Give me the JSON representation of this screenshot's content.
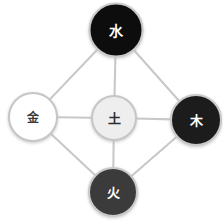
{
  "diagram": {
    "background_color": "#ffffff",
    "width": 223,
    "height": 224,
    "edge_color": "#c8c8c8",
    "edge_width": 2.1,
    "shadow_color": "#d9d9d9",
    "nodes": [
      {
        "id": "water",
        "label": "水",
        "position": "top",
        "cx": 116,
        "cy": 30,
        "r": 26.5,
        "fill": "#0a0a0a",
        "stroke": "#c9c9c9",
        "stroke_width": 2,
        "text_color": "#ffffff",
        "font_size": 14
      },
      {
        "id": "metal",
        "label": "金",
        "position": "left",
        "cx": 33,
        "cy": 117,
        "r": 24,
        "fill": "#ffffff",
        "stroke": "#c6c6c6",
        "stroke_width": 2,
        "text_color": "#3a3a3a",
        "font_size": 12
      },
      {
        "id": "earth",
        "label": "土",
        "position": "center",
        "cx": 114,
        "cy": 118,
        "r": 22,
        "fill": "#eeeeee",
        "stroke": "#c6c6c6",
        "stroke_width": 2,
        "text_color": "#2e2e2e",
        "font_size": 13
      },
      {
        "id": "wood",
        "label": "木",
        "position": "right",
        "cx": 196,
        "cy": 120,
        "r": 25,
        "fill": "#1c1c1c",
        "stroke": "#c9c9c9",
        "stroke_width": 2,
        "text_color": "#ffffff",
        "font_size": 13
      },
      {
        "id": "fire",
        "label": "火",
        "position": "bottom",
        "cx": 113,
        "cy": 192,
        "r": 24,
        "fill": "#3b3b3b",
        "stroke": "#c9c9c9",
        "stroke_width": 2,
        "text_color": "#ffffff",
        "font_size": 13
      }
    ],
    "edges": [
      {
        "id": "water-metal",
        "from": "water",
        "to": "metal"
      },
      {
        "id": "water-wood",
        "from": "water",
        "to": "wood"
      },
      {
        "id": "metal-fire",
        "from": "metal",
        "to": "fire"
      },
      {
        "id": "wood-fire",
        "from": "wood",
        "to": "fire"
      },
      {
        "id": "earth-water",
        "from": "earth",
        "to": "water"
      },
      {
        "id": "earth-metal",
        "from": "earth",
        "to": "metal"
      },
      {
        "id": "earth-wood",
        "from": "earth",
        "to": "wood"
      },
      {
        "id": "earth-fire",
        "from": "earth",
        "to": "fire"
      }
    ]
  }
}
